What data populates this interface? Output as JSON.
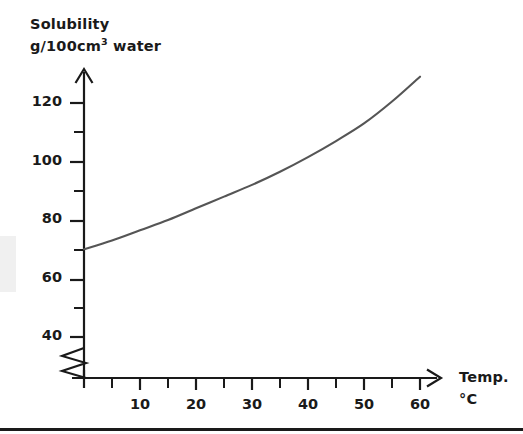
{
  "chart_data": {
    "type": "line",
    "title": "",
    "ylabel_line1": "Solubility",
    "ylabel_line2_prefix": "g/100cm",
    "ylabel_line2_sup": "3",
    "ylabel_line2_suffix": " water",
    "xlabel_line1": "Temp.",
    "xlabel_line2": "°C",
    "xlim": [
      0,
      66
    ],
    "ylim": [
      30,
      136
    ],
    "y_axis_break": true,
    "grid": false,
    "legend": null,
    "x_major_ticks": [
      10,
      20,
      30,
      40,
      50,
      60
    ],
    "x_minor_ticks": [
      5,
      15,
      25,
      35,
      45,
      55
    ],
    "x_tick_labels": [
      "10",
      "20",
      "30",
      "40",
      "50",
      "60"
    ],
    "y_major_ticks": [
      40,
      60,
      80,
      100,
      120
    ],
    "y_minor_ticks": [
      50,
      70,
      90,
      110
    ],
    "y_tick_labels": [
      "40",
      "60",
      "80",
      "100",
      "120"
    ],
    "series": [
      {
        "name": "solubility curve",
        "color": "#555555",
        "x": [
          0,
          5,
          10,
          15,
          20,
          25,
          30,
          35,
          40,
          45,
          50,
          55,
          60
        ],
        "y": [
          70,
          73,
          76.5,
          80,
          84,
          88,
          92,
          96.5,
          101.5,
          107,
          113,
          120.5,
          129
        ]
      }
    ]
  },
  "colors": {
    "axis": "#1a1a1a",
    "curve": "#555555",
    "text": "#1a1a1a",
    "background": "#ffffff"
  }
}
